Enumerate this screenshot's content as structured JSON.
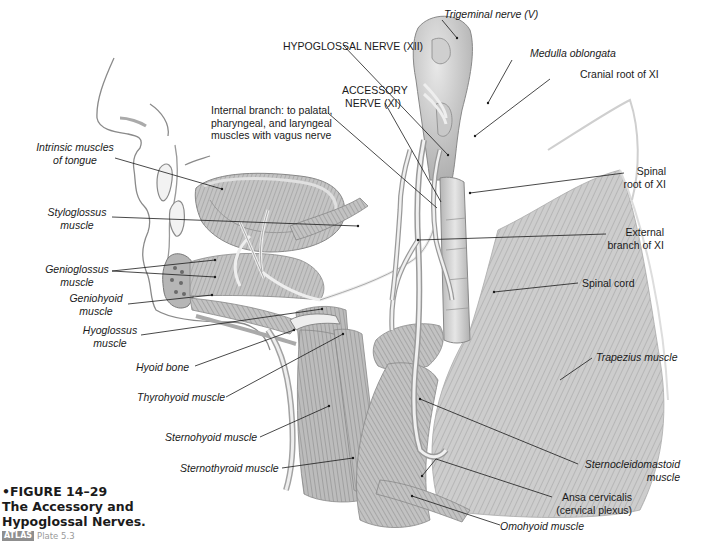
{
  "figure": {
    "number_label": "FIGURE 14–29",
    "title_line1": "The Accessory and",
    "title_line2": "Hypoglossal Nerves.",
    "atlas_tag": "ATLAS",
    "atlas_plate": "Plate 5.3",
    "bullet": "•"
  },
  "labels": {
    "trigeminal": "Trigeminal nerve (V)",
    "medulla": "Medulla oblongata",
    "hypoglossal_nerve": "HYPOGLOSSAL NERVE (XII)",
    "cranial_root": "Cranial root of XI",
    "accessory_line1": "ACCESSORY",
    "accessory_line2": "NERVE (XI)",
    "internal_branch_line1": "Internal branch: to palatal,",
    "internal_branch_line2": "pharyngeal, and laryngeal",
    "internal_branch_line3": "muscles with vagus nerve",
    "intrinsic_line1": "Intrinsic muscles",
    "intrinsic_line2": "of tongue",
    "spinal_root_line1": "Spinal",
    "spinal_root_line2": "root of XI",
    "styloglossus_line1": "Styloglossus",
    "styloglossus_line2": "muscle",
    "external_branch_line1": "External",
    "external_branch_line2": "branch of XI",
    "genioglossus_line1": "Genioglossus",
    "genioglossus_line2": "muscle",
    "spinal_cord": "Spinal cord",
    "geniohyoid_line1": "Geniohyoid",
    "geniohyoid_line2": "muscle",
    "hyoglossus_line1": "Hyoglossus",
    "hyoglossus_line2": "muscle",
    "hyoid_bone": "Hyoid bone",
    "trapezius": "Trapezius muscle",
    "thyrohyoid": "Thyrohyoid muscle",
    "sternohyoid": "Sternohyoid muscle",
    "sternocleidomastoid_line1": "Sternocleidomastoid",
    "sternocleidomastoid_line2": "muscle",
    "sternothyroid": "Sternothyroid muscle",
    "ansa_line1": "Ansa cervicalis",
    "ansa_line2": "(cervical plexus)",
    "omohyoid": "Omohyoid muscle"
  },
  "colors": {
    "muscle_fill": "#bdbdbd",
    "muscle_dark": "#8c8c8c",
    "nerve_fill": "#e4e4e4",
    "outline": "#777777",
    "leader": "#1a1a1a"
  }
}
